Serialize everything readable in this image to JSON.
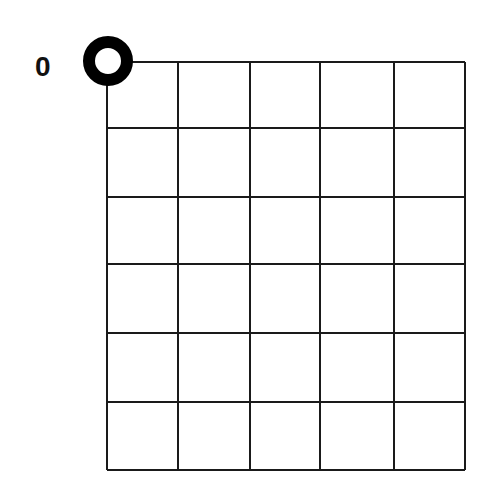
{
  "diagram": {
    "label": "0",
    "grid": {
      "columns": 5,
      "rows": 6,
      "col_x": [
        107,
        178,
        250,
        320,
        394,
        465
      ],
      "row_y": [
        62,
        128,
        197,
        264,
        333,
        402,
        470
      ]
    },
    "marker": {
      "type": "ring",
      "cx": 108,
      "cy": 61,
      "r": 19,
      "stroke_width": 12
    },
    "colors": {
      "line": "#1a1a1a",
      "background": "#ffffff"
    }
  }
}
